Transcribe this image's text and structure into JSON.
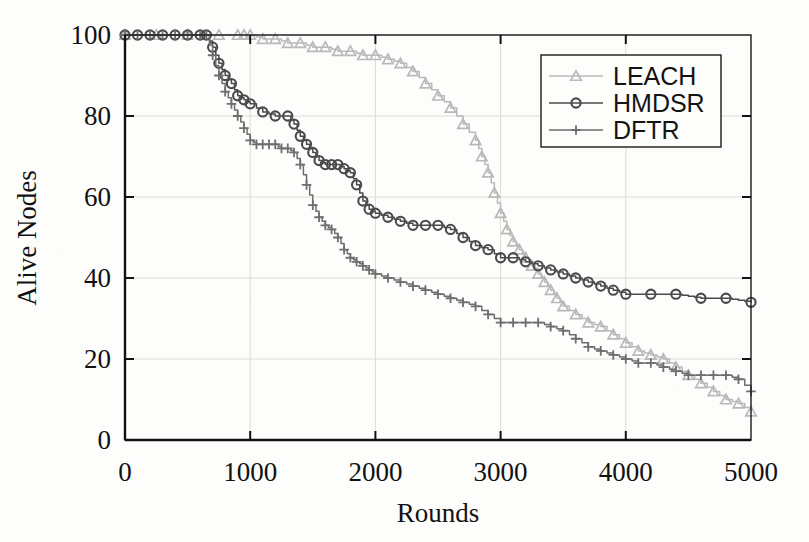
{
  "chart_data": {
    "type": "line",
    "title": "",
    "xlabel": "Rounds",
    "ylabel": "Alive Nodes",
    "xlim": [
      0,
      5000
    ],
    "ylim": [
      0,
      100
    ],
    "xticks": [
      0,
      1000,
      2000,
      3000,
      4000,
      5000
    ],
    "yticks": [
      0,
      20,
      40,
      60,
      80,
      100
    ],
    "xtick_labels": [
      "0",
      "1000",
      "2000",
      "3000",
      "4000",
      "5000"
    ],
    "ytick_labels": [
      "0",
      "20",
      "40",
      "60",
      "80",
      "100"
    ],
    "grid": true,
    "legend_position": "top-right",
    "series": [
      {
        "name": "LEACH",
        "color": "#b9b9b9",
        "marker": "triangle",
        "x": [
          0,
          250,
          500,
          750,
          900,
          950,
          1000,
          1100,
          1200,
          1300,
          1400,
          1500,
          1600,
          1700,
          1800,
          1900,
          2000,
          2100,
          2200,
          2300,
          2400,
          2500,
          2600,
          2700,
          2800,
          2850,
          2900,
          2950,
          3000,
          3050,
          3100,
          3150,
          3200,
          3250,
          3300,
          3350,
          3400,
          3450,
          3500,
          3600,
          3700,
          3800,
          3900,
          4000,
          4100,
          4200,
          4300,
          4400,
          4500,
          4600,
          4700,
          4800,
          4900,
          5000
        ],
        "y": [
          100,
          100,
          100,
          100,
          100,
          100,
          100,
          99,
          99,
          98,
          98,
          97,
          97,
          96,
          96,
          95,
          95,
          94,
          93,
          91,
          88,
          85,
          82,
          78,
          74,
          70,
          66,
          61,
          56,
          52,
          49,
          47,
          45,
          43,
          41,
          39,
          37,
          35,
          33,
          31,
          29,
          28,
          26,
          24,
          22,
          21,
          20,
          18,
          16,
          14,
          12,
          10,
          9,
          7
        ]
      },
      {
        "name": "HMDSR",
        "color": "#4b4b4b",
        "marker": "circle",
        "x": [
          0,
          100,
          200,
          300,
          400,
          500,
          600,
          650,
          700,
          750,
          800,
          850,
          900,
          950,
          1000,
          1100,
          1200,
          1300,
          1350,
          1400,
          1450,
          1500,
          1550,
          1600,
          1650,
          1700,
          1750,
          1800,
          1850,
          1900,
          1950,
          2000,
          2100,
          2200,
          2300,
          2400,
          2500,
          2600,
          2700,
          2800,
          2900,
          3000,
          3100,
          3200,
          3300,
          3400,
          3500,
          3600,
          3700,
          3800,
          3900,
          4000,
          4200,
          4400,
          4600,
          4800,
          5000
        ],
        "y": [
          100,
          100,
          100,
          100,
          100,
          100,
          100,
          100,
          97,
          93,
          90,
          88,
          85,
          84,
          83,
          81,
          80,
          80,
          78,
          75,
          73,
          71,
          69,
          68,
          68,
          68,
          67,
          66,
          63,
          59,
          57,
          56,
          55,
          54,
          53,
          53,
          53,
          52,
          50,
          48,
          47,
          45,
          45,
          44,
          43,
          42,
          41,
          40,
          39,
          38,
          37,
          36,
          36,
          36,
          35,
          35,
          34
        ]
      },
      {
        "name": "DFTR",
        "color": "#6e6e6e",
        "marker": "plus",
        "x": [
          0,
          100,
          200,
          300,
          400,
          500,
          600,
          650,
          700,
          750,
          800,
          850,
          900,
          950,
          1000,
          1050,
          1100,
          1150,
          1200,
          1250,
          1300,
          1350,
          1400,
          1450,
          1500,
          1550,
          1600,
          1650,
          1700,
          1750,
          1800,
          1850,
          1900,
          1950,
          2000,
          2100,
          2200,
          2300,
          2400,
          2500,
          2600,
          2700,
          2800,
          2900,
          3000,
          3100,
          3200,
          3300,
          3400,
          3500,
          3600,
          3700,
          3800,
          3900,
          4000,
          4100,
          4200,
          4300,
          4400,
          4500,
          4600,
          4700,
          4800,
          4900,
          5000
        ],
        "y": [
          100,
          100,
          100,
          100,
          100,
          100,
          100,
          100,
          95,
          90,
          86,
          83,
          80,
          77,
          74,
          73,
          73,
          73,
          73,
          72,
          72,
          71,
          68,
          63,
          58,
          55,
          53,
          52,
          50,
          47,
          45,
          44,
          43,
          42,
          41,
          40,
          39,
          38,
          37,
          36,
          35,
          34,
          33,
          31,
          29,
          29,
          29,
          29,
          28,
          27,
          25,
          23,
          22,
          21,
          20,
          19,
          19,
          18,
          17,
          16,
          16,
          16,
          16,
          15,
          12
        ]
      }
    ]
  },
  "legend": {
    "entries": [
      {
        "label": "LEACH",
        "marker": "triangle-icon",
        "color": "#b9b9b9"
      },
      {
        "label": "HMDSR",
        "marker": "circle-icon",
        "color": "#4b4b4b"
      },
      {
        "label": "DFTR",
        "marker": "plus-icon",
        "color": "#6e6e6e"
      }
    ]
  }
}
